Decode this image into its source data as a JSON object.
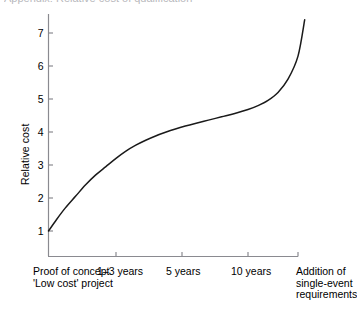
{
  "figure": {
    "top_fragment": "Appendix: Relative cost of qualification",
    "background_color": "#ffffff",
    "curve_color": "#1a1a1a",
    "axis_color": "#8a8a90"
  },
  "chart_data": {
    "type": "line",
    "title": "",
    "xlabel": "",
    "ylabel": "Relative cost",
    "ylim": [
      0,
      7.7
    ],
    "yticks": [
      1,
      2,
      3,
      4,
      5,
      6,
      7
    ],
    "ytick_labels": [
      "1",
      "2",
      "3",
      "4",
      "5",
      "6",
      "7"
    ],
    "grid": false,
    "legend": null,
    "categories": [
      "Proof of concept\n'Low cost' project",
      "1–3 years",
      "5 years",
      "10 years",
      "Addition of\nsingle-event\nrequirements"
    ],
    "xtick_positions": [
      0,
      1,
      2,
      3,
      3.75
    ],
    "series": [
      {
        "name": "Relative cost",
        "x": [
          0.0,
          0.12,
          0.25,
          0.4,
          0.55,
          0.7,
          0.85,
          1.0,
          1.15,
          1.3,
          1.45,
          1.6,
          1.75,
          1.9,
          2.05,
          2.2,
          2.4,
          2.6,
          2.8,
          3.0,
          3.15,
          3.3,
          3.45,
          3.6,
          3.75,
          3.85
        ],
        "values": [
          1.0,
          1.35,
          1.7,
          2.05,
          2.4,
          2.7,
          2.95,
          3.2,
          3.42,
          3.6,
          3.75,
          3.88,
          3.99,
          4.09,
          4.18,
          4.26,
          4.36,
          4.46,
          4.56,
          4.68,
          4.8,
          4.96,
          5.2,
          5.6,
          6.3,
          7.4
        ]
      }
    ],
    "annotations": []
  }
}
